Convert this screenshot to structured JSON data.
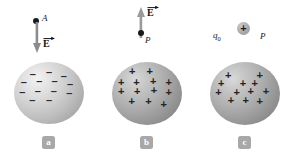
{
  "figure": {
    "background_color": "#ffffff",
    "width": 293,
    "height": 158
  },
  "panels": [
    {
      "id": "a",
      "badge_label": "a",
      "point": {
        "label": "A",
        "dot_color": "#1a1a1a"
      },
      "field_arrow": {
        "label": "E",
        "label_style": "bold-vector",
        "direction": "down",
        "color": "#8c8c8c"
      },
      "sphere": {
        "charge": "negative",
        "sign_glyph": "–",
        "sign_count": 13,
        "shade": "light",
        "fill_light": "#f2f2f2",
        "fill_dark": "#9a9a9a"
      }
    },
    {
      "id": "b",
      "badge_label": "b",
      "point": {
        "label": "P",
        "dot_color": "#1a1a1a"
      },
      "field_arrow": {
        "label": "E",
        "label_style": "bold-vector",
        "direction": "up",
        "color": "#9a9a9a"
      },
      "sphere": {
        "charge": "positive",
        "sign_glyph": "+",
        "sign_count": 13,
        "shade": "dark",
        "fill_light": "#d8d8d8",
        "fill_dark": "#7a7a7a"
      }
    },
    {
      "id": "c",
      "badge_label": "c",
      "point": {
        "label": "P",
        "dot_color": "#1a1a1a"
      },
      "test_charge": {
        "label": "q",
        "subscript": "0",
        "sign_glyph": "+"
      },
      "sphere": {
        "charge": "positive",
        "sign_glyph": "+",
        "sign_count": 12,
        "shade": "dark",
        "fill_light": "#d8d8d8",
        "fill_dark": "#7a7a7a"
      }
    }
  ],
  "sphere_signs": {
    "negative_positions": [
      {
        "x": 27,
        "y": 19
      },
      {
        "x": 50,
        "y": 16
      },
      {
        "x": 71,
        "y": 22
      },
      {
        "x": 14,
        "y": 33
      },
      {
        "x": 36,
        "y": 31
      },
      {
        "x": 58,
        "y": 30
      },
      {
        "x": 78,
        "y": 35
      },
      {
        "x": 12,
        "y": 46
      },
      {
        "x": 34,
        "y": 45
      },
      {
        "x": 57,
        "y": 45
      },
      {
        "x": 77,
        "y": 48
      },
      {
        "x": 26,
        "y": 59
      },
      {
        "x": 50,
        "y": 59
      }
    ],
    "positive_b_positions": [
      {
        "x": 29,
        "y": 15
      },
      {
        "x": 54,
        "y": 14
      },
      {
        "x": 13,
        "y": 30
      },
      {
        "x": 35,
        "y": 30
      },
      {
        "x": 59,
        "y": 29
      },
      {
        "x": 80,
        "y": 31
      },
      {
        "x": 13,
        "y": 45
      },
      {
        "x": 36,
        "y": 45
      },
      {
        "x": 60,
        "y": 44
      },
      {
        "x": 80,
        "y": 46
      },
      {
        "x": 28,
        "y": 59
      },
      {
        "x": 52,
        "y": 59
      },
      {
        "x": 74,
        "y": 63
      }
    ],
    "positive_c_positions": [
      {
        "x": 26,
        "y": 21
      },
      {
        "x": 71,
        "y": 20
      },
      {
        "x": 47,
        "y": 33
      },
      {
        "x": 64,
        "y": 33
      },
      {
        "x": 12,
        "y": 45
      },
      {
        "x": 38,
        "y": 45
      },
      {
        "x": 58,
        "y": 44
      },
      {
        "x": 79,
        "y": 44
      },
      {
        "x": 30,
        "y": 58
      },
      {
        "x": 51,
        "y": 58
      },
      {
        "x": 71,
        "y": 59
      },
      {
        "x": 16,
        "y": 33
      }
    ]
  }
}
